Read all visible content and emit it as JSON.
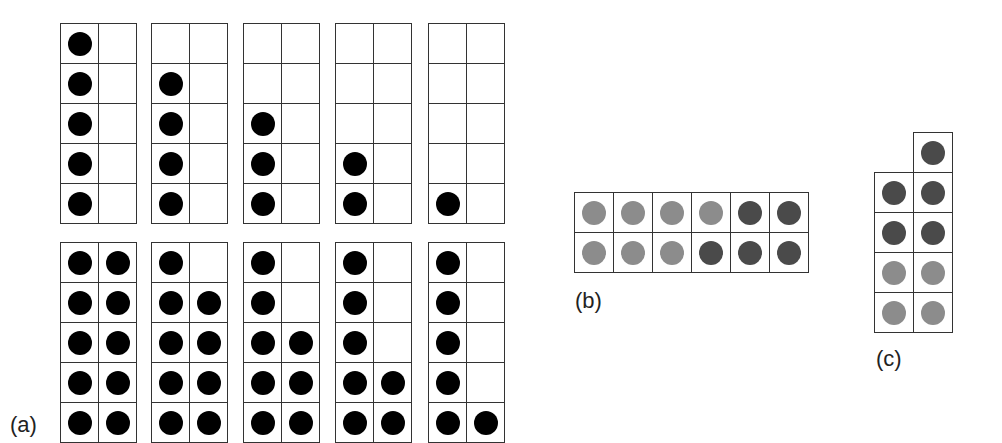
{
  "labels": {
    "a": "(a)",
    "b": "(b)",
    "c": "(c)"
  },
  "colors": {
    "black": "#000000",
    "light": "#8c8c8c",
    "dark": "#4a4a4a"
  },
  "panel_a": {
    "top_row": [
      {
        "left": [
          1,
          1,
          1,
          1,
          1
        ],
        "right": [
          0,
          0,
          0,
          0,
          0
        ]
      },
      {
        "left": [
          0,
          1,
          1,
          1,
          1
        ],
        "right": [
          0,
          0,
          0,
          0,
          0
        ]
      },
      {
        "left": [
          0,
          0,
          1,
          1,
          1
        ],
        "right": [
          0,
          0,
          0,
          0,
          0
        ]
      },
      {
        "left": [
          0,
          0,
          0,
          1,
          1
        ],
        "right": [
          0,
          0,
          0,
          0,
          0
        ]
      },
      {
        "left": [
          0,
          0,
          0,
          0,
          1
        ],
        "right": [
          0,
          0,
          0,
          0,
          0
        ]
      }
    ],
    "bottom_row": [
      {
        "left": [
          1,
          1,
          1,
          1,
          1
        ],
        "right": [
          1,
          1,
          1,
          1,
          1
        ]
      },
      {
        "left": [
          1,
          1,
          1,
          1,
          1
        ],
        "right": [
          0,
          1,
          1,
          1,
          1
        ]
      },
      {
        "left": [
          1,
          1,
          1,
          1,
          1
        ],
        "right": [
          0,
          0,
          1,
          1,
          1
        ]
      },
      {
        "left": [
          1,
          1,
          1,
          1,
          1
        ],
        "right": [
          0,
          0,
          0,
          1,
          1
        ]
      },
      {
        "left": [
          1,
          1,
          1,
          1,
          1
        ],
        "right": [
          0,
          0,
          0,
          0,
          1
        ]
      }
    ]
  },
  "panel_b": {
    "rows": [
      [
        "light",
        "light",
        "light",
        "light",
        "dark",
        "dark"
      ],
      [
        "light",
        "light",
        "light",
        "dark",
        "dark",
        "dark"
      ]
    ]
  },
  "panel_c": {
    "rows": [
      [
        null,
        "dark"
      ],
      [
        "dark",
        "dark"
      ],
      [
        "dark",
        "dark"
      ],
      [
        "light",
        "light"
      ],
      [
        "light",
        "light"
      ]
    ]
  }
}
